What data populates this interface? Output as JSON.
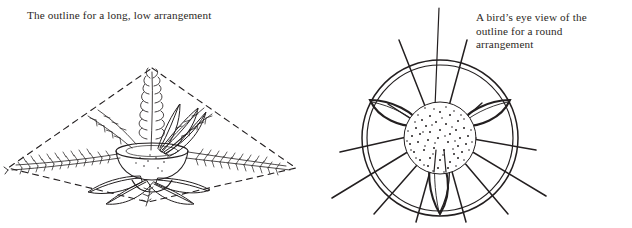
{
  "page": {
    "background_color": "#ffffff",
    "ink_color": "#231f20",
    "text_color": "#2b2724",
    "width": 632,
    "height": 228,
    "kind": "line-art illustration plate"
  },
  "figures": [
    {
      "id": "long-low",
      "caption": "The outline for a long, low arrangement",
      "illustration_name": "long-low-arrangement-illustration",
      "outline_shape": "dashed diamond (rhombus)",
      "outline_style": "dashed",
      "contents": [
        "shallow oval bowl",
        "tall central spike of foliage",
        "horizontal sprays of fern-like foliage",
        "broad pointed leaves radiating outward"
      ]
    },
    {
      "id": "round",
      "caption": "A bird’s eye view of the\noutline for a round\narrangement",
      "illustration_name": "round-arrangement-illustration",
      "outline_shape": "two concentric circles",
      "outline_style": "solid",
      "contents": [
        "stippled circular center",
        "radiating straight stems",
        "four pointed leaf shapes with midribs"
      ]
    }
  ]
}
